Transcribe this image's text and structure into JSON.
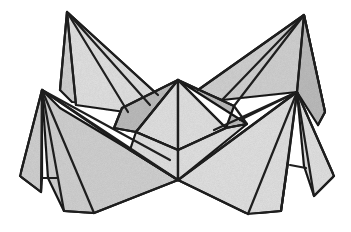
{
  "figure": {
    "width": 351,
    "height": 232,
    "colors": {
      "background": "#ffffff",
      "stroke": "#1e1e1e",
      "facet_light": "#e2e2e2",
      "facet_mid": "#d2d2d2",
      "facet_dark": "#bdbdbd",
      "facet_shadow": "#adadad"
    },
    "stroke_width": 2.2,
    "vertices": {
      "left_tall_peak": [
        67,
        12
      ],
      "right_tall_peak": [
        304,
        15
      ],
      "center_peak": [
        178,
        80
      ],
      "left_small_peak": [
        42,
        90
      ],
      "right_small_peak": [
        297,
        92
      ],
      "bottom_center": [
        178,
        180
      ]
    },
    "facets": [
      {
        "name": "back-left-flap",
        "shade": "facet_mid",
        "points": [
          [
            67,
            12
          ],
          [
            60,
            90
          ],
          [
            72,
            102
          ],
          [
            150,
            105
          ],
          [
            120,
            95
          ]
        ]
      },
      {
        "name": "back-left-flap-inner",
        "shade": "facet_light",
        "points": [
          [
            67,
            12
          ],
          [
            76,
            105
          ],
          [
            125,
            112
          ],
          [
            158,
            95
          ]
        ]
      },
      {
        "name": "back-right-flap",
        "shade": "facet_mid",
        "points": [
          [
            304,
            15
          ],
          [
            198,
            90
          ],
          [
            222,
            100
          ],
          [
            297,
            92
          ],
          [
            325,
            112
          ]
        ]
      },
      {
        "name": "back-right-flap-outer",
        "shade": "facet_dark",
        "points": [
          [
            304,
            15
          ],
          [
            297,
            92
          ],
          [
            318,
            125
          ],
          [
            325,
            112
          ]
        ]
      },
      {
        "name": "center-left-shoulder",
        "shade": "facet_dark",
        "points": [
          [
            178,
            80
          ],
          [
            122,
            108
          ],
          [
            114,
            128
          ],
          [
            136,
            132
          ]
        ]
      },
      {
        "name": "center-right-shoulder",
        "shade": "facet_dark",
        "points": [
          [
            178,
            80
          ],
          [
            234,
            106
          ],
          [
            226,
            128
          ],
          [
            247,
            124
          ]
        ]
      },
      {
        "name": "center-left-face",
        "shade": "facet_light",
        "points": [
          [
            178,
            80
          ],
          [
            136,
            132
          ],
          [
            178,
            150
          ]
        ]
      },
      {
        "name": "center-right-face",
        "shade": "facet_light",
        "points": [
          [
            178,
            80
          ],
          [
            178,
            150
          ],
          [
            226,
            128
          ]
        ]
      },
      {
        "name": "front-left-body",
        "shade": "facet_mid",
        "points": [
          [
            42,
            90
          ],
          [
            48,
            178
          ],
          [
            64,
            211
          ],
          [
            94,
            213
          ],
          [
            178,
            180
          ],
          [
            130,
            150
          ],
          [
            60,
            108
          ]
        ]
      },
      {
        "name": "front-left-outer-flap",
        "shade": "facet_mid",
        "points": [
          [
            42,
            90
          ],
          [
            20,
            176
          ],
          [
            41,
            192
          ],
          [
            42,
            178
          ]
        ]
      },
      {
        "name": "front-right-body",
        "shade": "facet_light",
        "points": [
          [
            297,
            92
          ],
          [
            178,
            180
          ],
          [
            248,
            214
          ],
          [
            281,
            211
          ],
          [
            288,
            162
          ]
        ]
      },
      {
        "name": "front-right-outer-flap",
        "shade": "facet_light",
        "points": [
          [
            297,
            92
          ],
          [
            304,
            166
          ],
          [
            314,
            196
          ],
          [
            334,
            176
          ]
        ]
      },
      {
        "name": "front-center-lower-left",
        "shade": "facet_light",
        "points": [
          [
            130,
            150
          ],
          [
            178,
            180
          ],
          [
            178,
            150
          ],
          [
            136,
            132
          ]
        ]
      },
      {
        "name": "front-center-lower-right",
        "shade": "facet_light",
        "points": [
          [
            178,
            150
          ],
          [
            178,
            180
          ],
          [
            247,
            124
          ],
          [
            226,
            128
          ]
        ]
      }
    ],
    "fold_lines": [
      [
        [
          67,
          12
        ],
        [
          60,
          90
        ]
      ],
      [
        [
          67,
          12
        ],
        [
          76,
          105
        ]
      ],
      [
        [
          67,
          12
        ],
        [
          128,
          112
        ]
      ],
      [
        [
          67,
          12
        ],
        [
          150,
          105
        ]
      ],
      [
        [
          67,
          12
        ],
        [
          158,
          95
        ]
      ],
      [
        [
          304,
          15
        ],
        [
          198,
          90
        ]
      ],
      [
        [
          304,
          15
        ],
        [
          222,
          100
        ]
      ],
      [
        [
          304,
          15
        ],
        [
          234,
          106
        ]
      ],
      [
        [
          304,
          15
        ],
        [
          297,
          92
        ]
      ],
      [
        [
          304,
          15
        ],
        [
          325,
          112
        ]
      ],
      [
        [
          325,
          112
        ],
        [
          318,
          125
        ]
      ],
      [
        [
          178,
          80
        ],
        [
          122,
          108
        ]
      ],
      [
        [
          178,
          80
        ],
        [
          234,
          106
        ]
      ],
      [
        [
          178,
          80
        ],
        [
          178,
          180
        ]
      ],
      [
        [
          178,
          80
        ],
        [
          136,
          132
        ]
      ],
      [
        [
          178,
          80
        ],
        [
          226,
          128
        ]
      ],
      [
        [
          122,
          108
        ],
        [
          114,
          128
        ]
      ],
      [
        [
          114,
          128
        ],
        [
          136,
          132
        ]
      ],
      [
        [
          234,
          106
        ],
        [
          247,
          124
        ]
      ],
      [
        [
          226,
          128
        ],
        [
          247,
          124
        ]
      ],
      [
        [
          42,
          90
        ],
        [
          20,
          176
        ]
      ],
      [
        [
          20,
          176
        ],
        [
          41,
          192
        ]
      ],
      [
        [
          41,
          192
        ],
        [
          42,
          90
        ]
      ],
      [
        [
          42,
          178
        ],
        [
          57,
          178
        ]
      ],
      [
        [
          42,
          90
        ],
        [
          64,
          211
        ]
      ],
      [
        [
          42,
          90
        ],
        [
          94,
          213
        ]
      ],
      [
        [
          42,
          90
        ],
        [
          178,
          180
        ]
      ],
      [
        [
          42,
          90
        ],
        [
          130,
          150
        ]
      ],
      [
        [
          42,
          90
        ],
        [
          170,
          160
        ]
      ],
      [
        [
          64,
          211
        ],
        [
          94,
          213
        ]
      ],
      [
        [
          94,
          213
        ],
        [
          178,
          180
        ]
      ],
      [
        [
          130,
          150
        ],
        [
          178,
          180
        ]
      ],
      [
        [
          297,
          92
        ],
        [
          178,
          180
        ]
      ],
      [
        [
          297,
          92
        ],
        [
          248,
          214
        ]
      ],
      [
        [
          297,
          92
        ],
        [
          281,
          211
        ]
      ],
      [
        [
          297,
          92
        ],
        [
          240,
          120
        ]
      ],
      [
        [
          297,
          92
        ],
        [
          214,
          130
        ]
      ],
      [
        [
          297,
          92
        ],
        [
          334,
          176
        ]
      ],
      [
        [
          297,
          92
        ],
        [
          314,
          196
        ]
      ],
      [
        [
          334,
          176
        ],
        [
          314,
          196
        ]
      ],
      [
        [
          290,
          165
        ],
        [
          306,
          168
        ]
      ],
      [
        [
          178,
          180
        ],
        [
          248,
          214
        ]
      ],
      [
        [
          248,
          214
        ],
        [
          281,
          211
        ]
      ],
      [
        [
          281,
          211
        ],
        [
          288,
          162
        ]
      ],
      [
        [
          136,
          132
        ],
        [
          178,
          150
        ]
      ],
      [
        [
          178,
          150
        ],
        [
          226,
          128
        ]
      ]
    ]
  }
}
